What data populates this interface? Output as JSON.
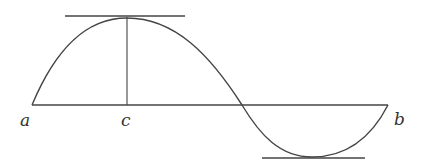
{
  "diagram": {
    "stroke_color": "#444444",
    "labels": {
      "a": "a",
      "c": "c",
      "b": "b"
    }
  }
}
